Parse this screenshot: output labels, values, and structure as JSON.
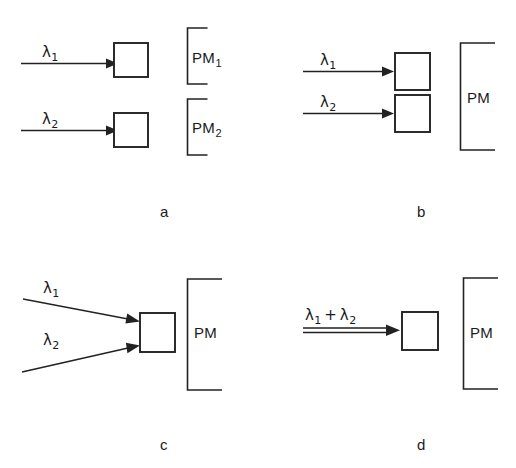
{
  "figure": {
    "background_color": "#ffffff",
    "ink_color": "#222222",
    "panels": [
      {
        "letter": "a",
        "beams": [
          {
            "label": "λ",
            "subscript": "1",
            "arrow_style": "single-horizontal"
          },
          {
            "label": "λ",
            "subscript": "2",
            "arrow_style": "single-horizontal"
          }
        ],
        "boxes": 2,
        "detectors": [
          {
            "label": "PM",
            "subscript": "1"
          },
          {
            "label": "PM",
            "subscript": "2"
          }
        ]
      },
      {
        "letter": "b",
        "beams": [
          {
            "label": "λ",
            "subscript": "1",
            "arrow_style": "single-horizontal"
          },
          {
            "label": "λ",
            "subscript": "2",
            "arrow_style": "single-horizontal"
          }
        ],
        "boxes": 2,
        "detectors": [
          {
            "label": "PM",
            "subscript": ""
          }
        ]
      },
      {
        "letter": "c",
        "beams": [
          {
            "label": "λ",
            "subscript": "1",
            "arrow_style": "diagonal-down"
          },
          {
            "label": "λ",
            "subscript": "2",
            "arrow_style": "diagonal-up"
          }
        ],
        "boxes": 1,
        "detectors": [
          {
            "label": "PM",
            "subscript": ""
          }
        ]
      },
      {
        "letter": "d",
        "beams": [
          {
            "label": "λ₁ + λ₂",
            "subscript": "",
            "arrow_style": "double-horizontal"
          }
        ],
        "boxes": 1,
        "detectors": [
          {
            "label": "PM",
            "subscript": ""
          }
        ]
      }
    ]
  },
  "labels": {
    "a": {
      "lambda1": "λ",
      "lambda1_sub": "1",
      "lambda2": "λ",
      "lambda2_sub": "2",
      "pm1": "PM",
      "pm1_sub": "1",
      "pm2": "PM",
      "pm2_sub": "2",
      "letter": "a"
    },
    "b": {
      "lambda1": "λ",
      "lambda1_sub": "1",
      "lambda2": "λ",
      "lambda2_sub": "2",
      "pm": "PM",
      "letter": "b"
    },
    "c": {
      "lambda1": "λ",
      "lambda1_sub": "1",
      "lambda2": "λ",
      "lambda2_sub": "2",
      "pm": "PM",
      "letter": "c"
    },
    "d": {
      "lambda_sum_first": "λ",
      "lambda_sum_first_sub": "1",
      "lambda_sum_plus": "+",
      "lambda_sum_second": "λ",
      "lambda_sum_second_sub": "2",
      "pm": "PM",
      "letter": "d"
    }
  }
}
